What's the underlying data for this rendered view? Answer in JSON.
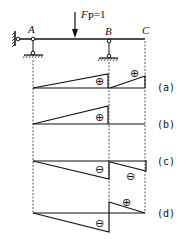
{
  "beam": {
    "points": [
      {
        "label": "A",
        "x": 33
      },
      {
        "label": "B",
        "x": 109
      },
      {
        "label": "C",
        "x": 145
      }
    ],
    "load": {
      "label": "F",
      "subscript": "P",
      "value": "=1",
      "x": 75
    }
  },
  "diagrams": [
    {
      "tag": "(a)",
      "signs": [
        "⊕",
        "⊕"
      ]
    },
    {
      "tag": "(b)",
      "signs": [
        "⊕"
      ]
    },
    {
      "tag": "(c)",
      "signs": [
        "⊖",
        "⊖"
      ]
    },
    {
      "tag": "(d)",
      "signs": [
        "⊖",
        "⊕"
      ]
    }
  ],
  "colors": {
    "line": "#111111",
    "background": "#ffffff"
  }
}
